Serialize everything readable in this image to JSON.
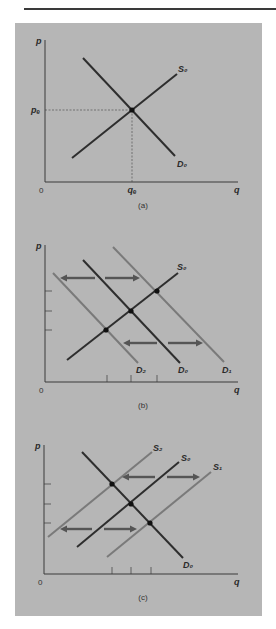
{
  "colors": {
    "background": "#ffffff",
    "panel": "#b6b6b6",
    "axis": "#3a3a3a",
    "primary_curve": "#2e2e2e",
    "shifted_curve": "#7a7a7a",
    "arrow": "#555555",
    "dashed": "#555555",
    "rule": "#3a3a3a"
  },
  "chart_data": [
    {
      "type": "line",
      "id": "a",
      "caption": "(a)",
      "title": "Market equilibrium",
      "xlabel": "q",
      "ylabel": "p",
      "origin_label": "0",
      "axis": {
        "x0": 45,
        "y0": 182,
        "xend": 238,
        "ytop": 40
      },
      "series": [
        {
          "name": "S0",
          "label": "S₀",
          "role": "supply",
          "shade": "primary",
          "x1": 72,
          "y1": 158,
          "x2": 177,
          "y2": 74,
          "lx": 178,
          "ly": 72
        },
        {
          "name": "D0",
          "label": "D₀",
          "role": "demand",
          "shade": "primary",
          "x1": 83,
          "y1": 58,
          "x2": 175,
          "y2": 156,
          "lx": 177,
          "ly": 167
        }
      ],
      "equilibria": [
        {
          "x": 132,
          "y": 110
        }
      ],
      "guides": {
        "pe_label": "pₑ",
        "qe_label": "qₑ",
        "x": 132,
        "y": 110
      },
      "y_ticks": [],
      "x_ticks": [],
      "arrows": []
    },
    {
      "type": "line",
      "id": "b",
      "caption": "(b)",
      "title": "Demand shifts",
      "xlabel": "q",
      "ylabel": "p",
      "origin_label": "0",
      "axis": {
        "x0": 45,
        "y0": 382,
        "xend": 238,
        "ytop": 245
      },
      "series": [
        {
          "name": "D2",
          "label": "D₂",
          "role": "demand",
          "shade": "shifted",
          "x1": 53,
          "y1": 273,
          "x2": 138,
          "y2": 363,
          "lx": 136,
          "ly": 373
        },
        {
          "name": "D0",
          "label": "D₀",
          "role": "demand",
          "shade": "primary",
          "x1": 83,
          "y1": 260,
          "x2": 180,
          "y2": 363,
          "lx": 178,
          "ly": 373
        },
        {
          "name": "D1",
          "label": "D₁",
          "role": "demand",
          "shade": "shifted",
          "x1": 113,
          "y1": 247,
          "x2": 224,
          "y2": 362,
          "lx": 222,
          "ly": 373
        },
        {
          "name": "S0",
          "label": "S₀",
          "role": "supply",
          "shade": "primary",
          "x1": 67,
          "y1": 360,
          "x2": 178,
          "y2": 273,
          "lx": 177,
          "ly": 270
        }
      ],
      "equilibria": [
        {
          "x": 106,
          "y": 330
        },
        {
          "x": 131,
          "y": 311
        },
        {
          "x": 157,
          "y": 291
        }
      ],
      "y_ticks": [
        291,
        311,
        330
      ],
      "x_ticks": [
        107,
        131,
        157
      ],
      "arrows": [
        {
          "x1": 95,
          "y": 278,
          "x2": 60,
          "direction": "left"
        },
        {
          "x1": 105,
          "y": 278,
          "x2": 140,
          "direction": "right"
        },
        {
          "x1": 157,
          "y": 343,
          "x2": 123,
          "direction": "left"
        },
        {
          "x1": 168,
          "y": 343,
          "x2": 203,
          "direction": "right"
        }
      ]
    },
    {
      "type": "line",
      "id": "c",
      "caption": "(c)",
      "title": "Supply shifts",
      "xlabel": "q",
      "ylabel": "p",
      "origin_label": "0",
      "axis": {
        "x0": 44,
        "y0": 574,
        "xend": 238,
        "ytop": 445
      },
      "series": [
        {
          "name": "S2",
          "label": "S₂",
          "role": "supply",
          "shade": "shifted",
          "x1": 48,
          "y1": 537,
          "x2": 152,
          "y2": 452,
          "lx": 153,
          "ly": 451
        },
        {
          "name": "S0",
          "label": "S₀",
          "role": "supply",
          "shade": "primary",
          "x1": 77,
          "y1": 547,
          "x2": 179,
          "y2": 462,
          "lx": 181,
          "ly": 461
        },
        {
          "name": "S1",
          "label": "S₁",
          "role": "supply",
          "shade": "shifted",
          "x1": 107,
          "y1": 557,
          "x2": 211,
          "y2": 472,
          "lx": 213,
          "ly": 470
        },
        {
          "name": "D0",
          "label": "D₀",
          "role": "demand",
          "shade": "primary",
          "x1": 82,
          "y1": 452,
          "x2": 183,
          "y2": 558,
          "lx": 183,
          "ly": 568
        }
      ],
      "equilibria": [
        {
          "x": 112,
          "y": 484
        },
        {
          "x": 131,
          "y": 504
        },
        {
          "x": 150,
          "y": 523
        }
      ],
      "y_ticks": [
        484,
        504,
        523
      ],
      "x_ticks": [
        112,
        131,
        151
      ],
      "arrows": [
        {
          "x1": 155,
          "y": 477,
          "x2": 122,
          "direction": "left"
        },
        {
          "x1": 167,
          "y": 477,
          "x2": 200,
          "direction": "right"
        },
        {
          "x1": 92,
          "y": 529,
          "x2": 60,
          "direction": "left"
        },
        {
          "x1": 104,
          "y": 529,
          "x2": 137,
          "direction": "right"
        }
      ]
    }
  ]
}
